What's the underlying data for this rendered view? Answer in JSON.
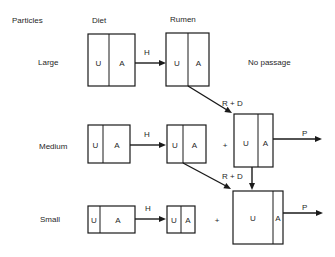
{
  "headers": {
    "particles": "Particles",
    "diet": "Diet",
    "rumen": "Rumen"
  },
  "rows": [
    {
      "label": "Large",
      "diet": {
        "u": "U",
        "a": "A"
      },
      "transfer": "H",
      "rumen": {
        "u": "U",
        "a": "A"
      },
      "outcome": "No passage"
    },
    {
      "label": "Medium",
      "diet": {
        "u": "U",
        "a": "A"
      },
      "transfer": "H",
      "rumen": {
        "u": "U",
        "a": "A"
      },
      "plus": "+",
      "inflow": "R + D",
      "pool": {
        "u": "U",
        "a": "A"
      },
      "passage": "P"
    },
    {
      "label": "Small",
      "diet": {
        "u": "U",
        "a": "A"
      },
      "transfer": "H",
      "rumen": {
        "u": "U",
        "a": "A"
      },
      "plus": "+",
      "inflow": "R + D",
      "pool": {
        "u": "U",
        "a": "A"
      },
      "passage": "P"
    }
  ]
}
